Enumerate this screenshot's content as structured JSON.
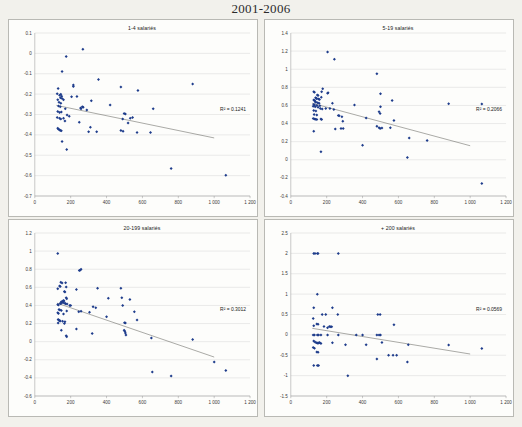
{
  "page_title": "2001-2006",
  "background_color": "#f2f1ec",
  "marker_color": "#1f3d8c",
  "trendline_color": "#55554e",
  "gridline_color": "#c8c8c8",
  "chart_data": [
    {
      "type": "scatter",
      "title": "1-4 salariés",
      "xlabel": "",
      "ylabel": "",
      "xlim": [
        0,
        1200
      ],
      "ylim": [
        -0.7,
        0.1
      ],
      "xticks": [
        0,
        200,
        400,
        600,
        800,
        1000,
        1200
      ],
      "xtick_labels": [
        "0",
        "200",
        "400",
        "600",
        "800",
        "1 000",
        "1 200"
      ],
      "yticks": [
        -0.7,
        -0.6,
        -0.5,
        -0.4,
        -0.3,
        -0.2,
        -0.1,
        0,
        0.1
      ],
      "ytick_labels": [
        "-0.7",
        "-0.6",
        "-0.5",
        "-0.4",
        "-0.3",
        "-0.2",
        "-0.1",
        "0",
        "0.1"
      ],
      "grid": true,
      "annotation": "R² = 0.1241",
      "trendline": {
        "x0": 120,
        "y0": -0.255,
        "x1": 1000,
        "y1": -0.415
      },
      "points": [
        [
          268,
          0.02
        ],
        [
          175,
          -0.015
        ],
        [
          152,
          -0.089
        ],
        [
          355,
          -0.128
        ],
        [
          880,
          -0.15
        ],
        [
          480,
          -0.165
        ],
        [
          215,
          -0.162
        ],
        [
          215,
          -0.155
        ],
        [
          130,
          -0.172
        ],
        [
          575,
          -0.182
        ],
        [
          205,
          -0.213
        ],
        [
          235,
          -0.212
        ],
        [
          125,
          -0.198
        ],
        [
          138,
          -0.205
        ],
        [
          145,
          -0.2
        ],
        [
          150,
          -0.21
        ],
        [
          143,
          -0.218
        ],
        [
          152,
          -0.222
        ],
        [
          128,
          -0.228
        ],
        [
          160,
          -0.228
        ],
        [
          315,
          -0.232
        ],
        [
          660,
          -0.272
        ],
        [
          420,
          -0.253
        ],
        [
          135,
          -0.24
        ],
        [
          145,
          -0.245
        ],
        [
          265,
          -0.262
        ],
        [
          270,
          -0.265
        ],
        [
          255,
          -0.268
        ],
        [
          258,
          -0.272
        ],
        [
          170,
          -0.272
        ],
        [
          290,
          -0.278
        ],
        [
          132,
          -0.258
        ],
        [
          142,
          -0.262
        ],
        [
          128,
          -0.285
        ],
        [
          138,
          -0.29
        ],
        [
          148,
          -0.288
        ],
        [
          498,
          -0.295
        ],
        [
          505,
          -0.298
        ],
        [
          180,
          -0.302
        ],
        [
          192,
          -0.308
        ],
        [
          125,
          -0.315
        ],
        [
          138,
          -0.318
        ],
        [
          145,
          -0.322
        ],
        [
          160,
          -0.318
        ],
        [
          490,
          -0.322
        ],
        [
          545,
          -0.315
        ],
        [
          532,
          -0.318
        ],
        [
          168,
          -0.332
        ],
        [
          248,
          -0.338
        ],
        [
          520,
          -0.342
        ],
        [
          128,
          -0.368
        ],
        [
          132,
          -0.372
        ],
        [
          138,
          -0.375
        ],
        [
          142,
          -0.378
        ],
        [
          148,
          -0.38
        ],
        [
          310,
          -0.362
        ],
        [
          300,
          -0.385
        ],
        [
          345,
          -0.385
        ],
        [
          480,
          -0.378
        ],
        [
          492,
          -0.382
        ],
        [
          570,
          -0.388
        ],
        [
          645,
          -0.388
        ],
        [
          152,
          -0.433
        ],
        [
          178,
          -0.472
        ],
        [
          760,
          -0.565
        ],
        [
          1065,
          -0.598
        ]
      ]
    },
    {
      "type": "scatter",
      "title": "5-19 salariés",
      "xlabel": "",
      "ylabel": "",
      "xlim": [
        0,
        1200
      ],
      "ylim": [
        -0.4,
        1.4
      ],
      "xticks": [
        0,
        200,
        400,
        600,
        800,
        1000,
        1200
      ],
      "xtick_labels": [
        "0",
        "200",
        "400",
        "600",
        "800",
        "1 000",
        "1 200"
      ],
      "yticks": [
        -0.4,
        -0.2,
        0,
        0.2,
        0.4,
        0.6,
        0.8,
        1.0,
        1.2,
        1.4
      ],
      "ytick_labels": [
        "-0.4",
        "-0.2",
        "0",
        "0.2",
        "0.4",
        "0.6",
        "0.8",
        "1",
        "1.2",
        "1.4"
      ],
      "grid": true,
      "annotation": "R² = 0.2066",
      "trendline": {
        "x0": 118,
        "y0": 0.625,
        "x1": 1000,
        "y1": 0.155
      },
      "points": [
        [
          205,
          1.19
        ],
        [
          243,
          1.11
        ],
        [
          480,
          0.95
        ],
        [
          178,
          0.785
        ],
        [
          172,
          0.75
        ],
        [
          128,
          0.75
        ],
        [
          132,
          0.745
        ],
        [
          208,
          0.74
        ],
        [
          205,
          0.735
        ],
        [
          500,
          0.73
        ],
        [
          148,
          0.715
        ],
        [
          152,
          0.71
        ],
        [
          170,
          0.69
        ],
        [
          138,
          0.685
        ],
        [
          142,
          0.68
        ],
        [
          145,
          0.675
        ],
        [
          155,
          0.67
        ],
        [
          160,
          0.665
        ],
        [
          128,
          0.66
        ],
        [
          133,
          0.655
        ],
        [
          565,
          0.655
        ],
        [
          880,
          0.62
        ],
        [
          136,
          0.64
        ],
        [
          140,
          0.635
        ],
        [
          150,
          0.63
        ],
        [
          158,
          0.625
        ],
        [
          1065,
          0.615
        ],
        [
          128,
          0.61
        ],
        [
          132,
          0.605
        ],
        [
          145,
          0.6
        ],
        [
          162,
          0.598
        ],
        [
          232,
          0.625
        ],
        [
          355,
          0.605
        ],
        [
          125,
          0.59
        ],
        [
          136,
          0.585
        ],
        [
          152,
          0.58
        ],
        [
          500,
          0.585
        ],
        [
          165,
          0.565
        ],
        [
          175,
          0.56
        ],
        [
          195,
          0.565
        ],
        [
          218,
          0.565
        ],
        [
          240,
          0.555
        ],
        [
          128,
          0.545
        ],
        [
          140,
          0.54
        ],
        [
          492,
          0.53
        ],
        [
          498,
          0.51
        ],
        [
          130,
          0.5
        ],
        [
          145,
          0.495
        ],
        [
          265,
          0.49
        ],
        [
          270,
          0.485
        ],
        [
          285,
          0.475
        ],
        [
          420,
          0.46
        ],
        [
          125,
          0.455
        ],
        [
          132,
          0.45
        ],
        [
          138,
          0.448
        ],
        [
          145,
          0.445
        ],
        [
          168,
          0.45
        ],
        [
          172,
          0.445
        ],
        [
          290,
          0.425
        ],
        [
          575,
          0.435
        ],
        [
          480,
          0.37
        ],
        [
          492,
          0.355
        ],
        [
          498,
          0.345
        ],
        [
          508,
          0.35
        ],
        [
          555,
          0.355
        ],
        [
          248,
          0.34
        ],
        [
          280,
          0.345
        ],
        [
          292,
          0.345
        ],
        [
          128,
          0.315
        ],
        [
          660,
          0.24
        ],
        [
          760,
          0.212
        ],
        [
          400,
          0.16
        ],
        [
          168,
          0.09
        ],
        [
          650,
          0.025
        ],
        [
          1065,
          -0.262
        ]
      ]
    },
    {
      "type": "scatter",
      "title": "20-199 salariés",
      "xlabel": "",
      "ylabel": "",
      "xlim": [
        0,
        1200
      ],
      "ylim": [
        -0.6,
        1.2
      ],
      "xticks": [
        0,
        200,
        400,
        600,
        800,
        1000,
        1200
      ],
      "xtick_labels": [
        "0",
        "200",
        "400",
        "600",
        "800",
        "1 000",
        "1 200"
      ],
      "yticks": [
        -0.6,
        -0.4,
        -0.2,
        0,
        0.2,
        0.4,
        0.6,
        0.8,
        1.0,
        1.2
      ],
      "ytick_labels": [
        "-0.6",
        "-0.4",
        "-0.2",
        "0",
        "0.2",
        "0.4",
        "0.6",
        "0.8",
        "1",
        "1.2"
      ],
      "grid": true,
      "annotation": "R² = 0.3012",
      "trendline": {
        "x0": 125,
        "y0": 0.425,
        "x1": 1000,
        "y1": -0.17
      },
      "points": [
        [
          128,
          0.975
        ],
        [
          248,
          0.785
        ],
        [
          252,
          0.79
        ],
        [
          258,
          0.8
        ],
        [
          145,
          0.655
        ],
        [
          152,
          0.648
        ],
        [
          172,
          0.65
        ],
        [
          138,
          0.615
        ],
        [
          142,
          0.61
        ],
        [
          175,
          0.605
        ],
        [
          232,
          0.575
        ],
        [
          350,
          0.59
        ],
        [
          480,
          0.59
        ],
        [
          128,
          0.585
        ],
        [
          165,
          0.555
        ],
        [
          168,
          0.548
        ],
        [
          175,
          0.485
        ],
        [
          178,
          0.475
        ],
        [
          410,
          0.48
        ],
        [
          485,
          0.485
        ],
        [
          530,
          0.465
        ],
        [
          160,
          0.455
        ],
        [
          163,
          0.45
        ],
        [
          155,
          0.445
        ],
        [
          148,
          0.44
        ],
        [
          152,
          0.435
        ],
        [
          158,
          0.43
        ],
        [
          142,
          0.425
        ],
        [
          145,
          0.42
        ],
        [
          168,
          0.425
        ],
        [
          172,
          0.42
        ],
        [
          180,
          0.415
        ],
        [
          195,
          0.4
        ],
        [
          200,
          0.4
        ],
        [
          490,
          0.4
        ],
        [
          128,
          0.41
        ],
        [
          132,
          0.405
        ],
        [
          325,
          0.385
        ],
        [
          340,
          0.375
        ],
        [
          135,
          0.355
        ],
        [
          140,
          0.35
        ],
        [
          148,
          0.345
        ],
        [
          178,
          0.34
        ],
        [
          245,
          0.33
        ],
        [
          258,
          0.335
        ],
        [
          305,
          0.325
        ],
        [
          555,
          0.33
        ],
        [
          128,
          0.32
        ],
        [
          132,
          0.312
        ],
        [
          160,
          0.305
        ],
        [
          400,
          0.275
        ],
        [
          570,
          0.24
        ],
        [
          130,
          0.245
        ],
        [
          134,
          0.24
        ],
        [
          138,
          0.232
        ],
        [
          142,
          0.228
        ],
        [
          155,
          0.225
        ],
        [
          168,
          0.22
        ],
        [
          500,
          0.21
        ],
        [
          505,
          0.205
        ],
        [
          130,
          0.205
        ],
        [
          165,
          0.2
        ],
        [
          148,
          0.125
        ],
        [
          232,
          0.14
        ],
        [
          498,
          0.125
        ],
        [
          502,
          0.115
        ],
        [
          505,
          0.095
        ],
        [
          320,
          0.09
        ],
        [
          508,
          0.075
        ],
        [
          175,
          0.065
        ],
        [
          178,
          0.055
        ],
        [
          650,
          0.04
        ],
        [
          880,
          0.025
        ],
        [
          1000,
          -0.225
        ],
        [
          655,
          -0.335
        ],
        [
          1065,
          -0.318
        ],
        [
          760,
          -0.378
        ]
      ]
    },
    {
      "type": "scatter",
      "title": "+ 200 salariés",
      "xlabel": "",
      "ylabel": "",
      "xlim": [
        0,
        1200
      ],
      "ylim": [
        -1.5,
        2.5
      ],
      "xticks": [
        0,
        200,
        400,
        600,
        800,
        1000,
        1200
      ],
      "xtick_labels": [
        "0",
        "200",
        "400",
        "600",
        "800",
        "1 000",
        "1 200"
      ],
      "yticks": [
        -1.5,
        -1.0,
        -0.5,
        0,
        0.5,
        1.0,
        1.5,
        2.0,
        2.5
      ],
      "ytick_labels": [
        "-1.5",
        "-1",
        "-0.5",
        "0",
        "0.5",
        "1",
        "1.5",
        "2",
        "2.5"
      ],
      "grid": true,
      "annotation": "R² = 0.0569",
      "trendline": {
        "x0": 120,
        "y0": 0.16,
        "x1": 1000,
        "y1": -0.47
      },
      "points": [
        [
          128,
          2.0
        ],
        [
          135,
          2.0
        ],
        [
          148,
          2.0
        ],
        [
          152,
          2.0
        ],
        [
          265,
          2.0
        ],
        [
          148,
          1.0
        ],
        [
          128,
          0.665
        ],
        [
          232,
          0.665
        ],
        [
          175,
          0.5
        ],
        [
          195,
          0.5
        ],
        [
          262,
          0.5
        ],
        [
          485,
          0.5
        ],
        [
          498,
          0.5
        ],
        [
          125,
          0.4
        ],
        [
          145,
          0.265
        ],
        [
          152,
          0.26
        ],
        [
          128,
          0.225
        ],
        [
          575,
          0.25
        ],
        [
          185,
          0.205
        ],
        [
          215,
          0.205
        ],
        [
          222,
          0.2
        ],
        [
          228,
          0.2
        ],
        [
          205,
          0.175
        ],
        [
          125,
          0.0
        ],
        [
          132,
          0.0
        ],
        [
          148,
          0.0
        ],
        [
          155,
          0.0
        ],
        [
          168,
          0.0
        ],
        [
          205,
          0.0
        ],
        [
          265,
          0.0
        ],
        [
          365,
          0.0
        ],
        [
          400,
          0.0
        ],
        [
          480,
          0.0
        ],
        [
          492,
          0.0
        ],
        [
          500,
          0.0
        ],
        [
          128,
          -0.15
        ],
        [
          135,
          -0.175
        ],
        [
          142,
          -0.195
        ],
        [
          148,
          -0.2
        ],
        [
          152,
          -0.205
        ],
        [
          158,
          -0.19
        ],
        [
          162,
          -0.195
        ],
        [
          168,
          -0.21
        ],
        [
          232,
          -0.195
        ],
        [
          508,
          -0.19
        ],
        [
          125,
          -0.31
        ],
        [
          132,
          -0.33
        ],
        [
          145,
          -0.42
        ],
        [
          152,
          -0.425
        ],
        [
          305,
          -0.245
        ],
        [
          420,
          -0.245
        ],
        [
          655,
          -0.245
        ],
        [
          880,
          -0.25
        ],
        [
          1065,
          -0.335
        ],
        [
          545,
          -0.5
        ],
        [
          570,
          -0.5
        ],
        [
          590,
          -0.5
        ],
        [
          480,
          -0.595
        ],
        [
          650,
          -0.665
        ],
        [
          128,
          -0.75
        ],
        [
          148,
          -0.75
        ],
        [
          155,
          -0.75
        ],
        [
          318,
          -1.0
        ]
      ]
    }
  ]
}
